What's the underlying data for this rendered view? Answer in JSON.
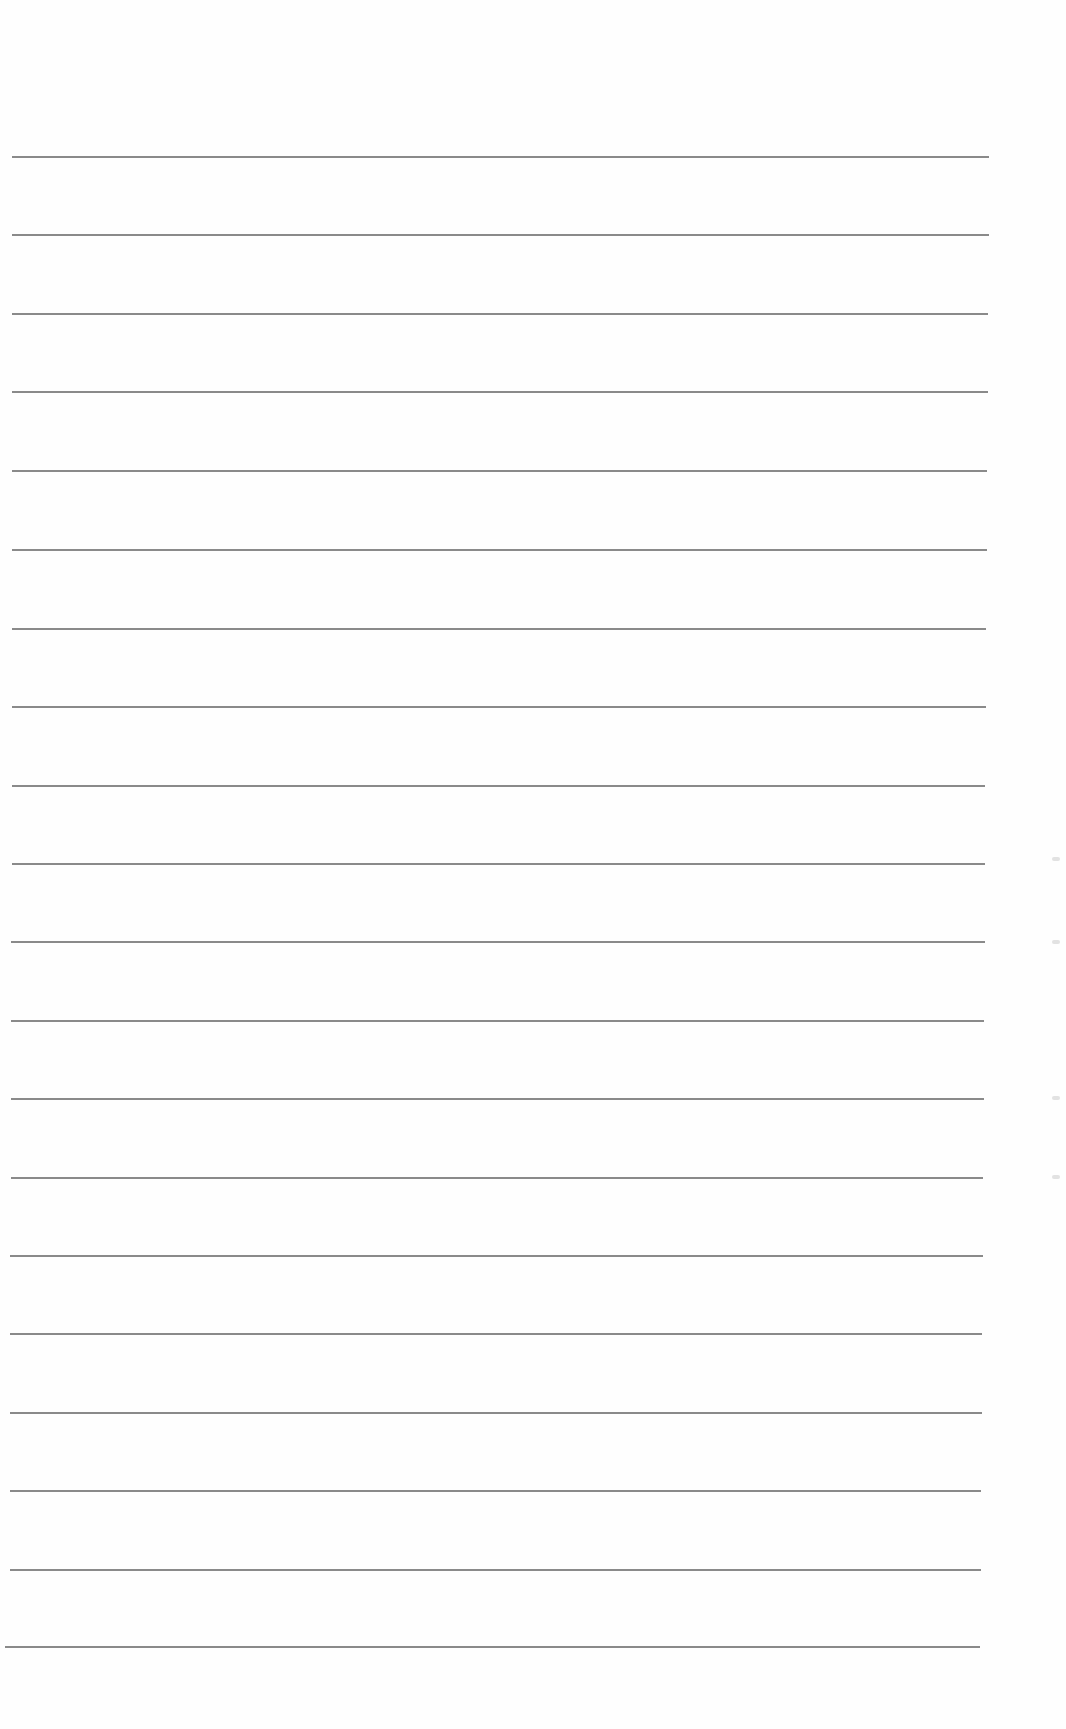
{
  "document": {
    "type": "lined-paper",
    "line_count": 20,
    "line_color": "#8a8a8a",
    "background": "#fefefe",
    "lines": [
      {
        "y": 156,
        "x1": 12,
        "x2": 989
      },
      {
        "y": 234,
        "x1": 12,
        "x2": 989
      },
      {
        "y": 313,
        "x1": 12,
        "x2": 988
      },
      {
        "y": 391,
        "x1": 12,
        "x2": 988
      },
      {
        "y": 470,
        "x1": 12,
        "x2": 987
      },
      {
        "y": 549,
        "x1": 12,
        "x2": 987
      },
      {
        "y": 628,
        "x1": 12,
        "x2": 986
      },
      {
        "y": 706,
        "x1": 12,
        "x2": 986
      },
      {
        "y": 785,
        "x1": 12,
        "x2": 985
      },
      {
        "y": 863,
        "x1": 12,
        "x2": 985
      },
      {
        "y": 941,
        "x1": 11,
        "x2": 985
      },
      {
        "y": 1020,
        "x1": 11,
        "x2": 984
      },
      {
        "y": 1098,
        "x1": 11,
        "x2": 984
      },
      {
        "y": 1177,
        "x1": 11,
        "x2": 983
      },
      {
        "y": 1255,
        "x1": 10,
        "x2": 983
      },
      {
        "y": 1333,
        "x1": 10,
        "x2": 982
      },
      {
        "y": 1412,
        "x1": 10,
        "x2": 982
      },
      {
        "y": 1490,
        "x1": 10,
        "x2": 981
      },
      {
        "y": 1569,
        "x1": 10,
        "x2": 981
      },
      {
        "y": 1646,
        "x1": 5,
        "x2": 980
      }
    ],
    "margin_marks_y": [
      857,
      940,
      1096,
      1175
    ]
  }
}
